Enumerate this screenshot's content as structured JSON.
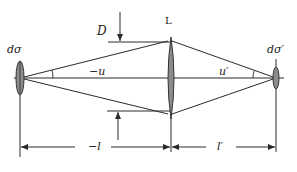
{
  "diagram": {
    "type": "optical-imaging-geometry",
    "colors": {
      "line": "#2a2a2a",
      "lens_fill": "#8c8c8c",
      "lens_stroke": "#333333",
      "background": "#ffffff"
    },
    "labels": {
      "object_element": "dσ",
      "image_element": "dσ′",
      "lens": "L",
      "aperture_diameter": "D",
      "object_angle": "−u",
      "image_angle": "u′",
      "object_distance": "−l",
      "image_distance": "l′"
    },
    "elements": {
      "object": {
        "x": 20,
        "y_center": 78,
        "height": 35
      },
      "lens": {
        "x": 170,
        "top": 38,
        "bottom": 118
      },
      "image": {
        "x": 276,
        "y_center": 78,
        "height": 23
      },
      "optical_axis_y": 78,
      "aperture_top_y": 42,
      "aperture_bottom_y": 111,
      "dimension_line_y": 147
    }
  }
}
